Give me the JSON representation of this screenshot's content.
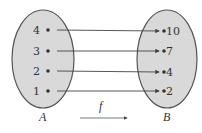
{
  "diagram": {
    "type": "function-mapping",
    "function_label": "f",
    "colors": {
      "set_fill": "#d9d9d9",
      "set_stroke": "#555555",
      "text": "#333333",
      "arrow": "#444444"
    },
    "domain": {
      "name": "A",
      "elements": [
        "4",
        "3",
        "2",
        "1"
      ]
    },
    "codomain": {
      "name": "B",
      "elements": [
        "10",
        "7",
        "4",
        "2"
      ]
    },
    "mappings": [
      {
        "from": "4",
        "to": "10"
      },
      {
        "from": "3",
        "to": "7"
      },
      {
        "from": "2",
        "to": "4"
      },
      {
        "from": "1",
        "to": "2"
      }
    ]
  }
}
